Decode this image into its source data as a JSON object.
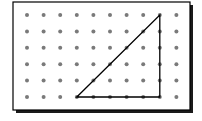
{
  "diagram": {
    "type": "geoboard",
    "grid": {
      "columns": 10,
      "rows": 6,
      "dot_color": "#7a7a7a"
    },
    "board": {
      "border_color": "#000000",
      "shadow_color": "#1a1a1a",
      "background": "#ffffff"
    },
    "shape": {
      "kind": "right-triangle",
      "vertices_grid": [
        [
          3,
          5
        ],
        [
          8,
          0
        ],
        [
          8,
          5
        ]
      ],
      "line_color": "#000000"
    }
  }
}
